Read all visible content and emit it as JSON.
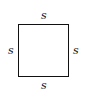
{
  "diagram": {
    "shape": "square",
    "labels": {
      "top": "s",
      "left": "s",
      "right": "s",
      "bottom": "s"
    },
    "stroke_color": "#111111"
  }
}
